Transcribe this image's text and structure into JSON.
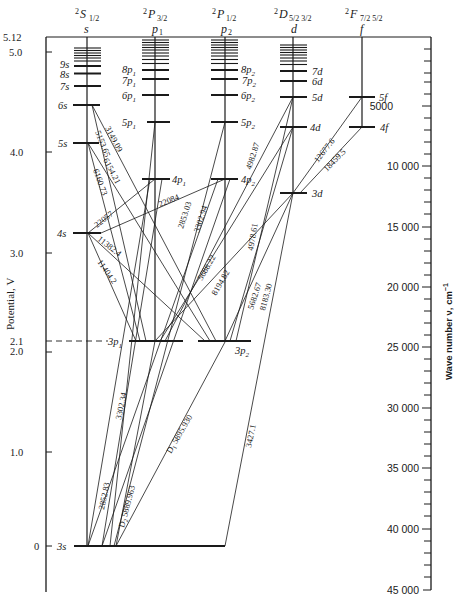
{
  "diagram": {
    "type": "Grotrian (energy-level) diagram of sodium",
    "columns": [
      {
        "term": "2S",
        "j": "1/2",
        "series": "s",
        "x": 87
      },
      {
        "term": "2P",
        "j": "3/2",
        "series": "p1",
        "x": 155
      },
      {
        "term": "2P",
        "j": "1/2",
        "series": "p2",
        "x": 225
      },
      {
        "term": "2D",
        "j": "5/2 3/2",
        "series": "d",
        "x": 293
      },
      {
        "term": "2F",
        "j": "7/2 5/2",
        "series": "f",
        "x": 362
      }
    ],
    "headers": {
      "s_term": "2",
      "s_letter": "S",
      "s_j": "1/2",
      "s_series": "s",
      "p1_term": "2",
      "p1_letter": "P",
      "p1_j": "3/2",
      "p1_series": "p",
      "p1_sub": "1",
      "p2_term": "2",
      "p2_letter": "P",
      "p2_j": "1/2",
      "p2_series": "p",
      "p2_sub": "2",
      "d_term": "2",
      "d_letter": "D",
      "d_j": "5/2 3/2",
      "d_series": "d",
      "f_term": "2",
      "f_letter": "F",
      "f_j": "7/2 5/2",
      "f_series": "f"
    },
    "left_axis": {
      "label": "Potential, V",
      "ticks": [
        "5.12",
        "5.0",
        "4.0",
        "3.0",
        "2.1",
        "2.0",
        "1.0",
        "0"
      ]
    },
    "right_axis": {
      "label": "Wave number ν, cm",
      "label_sup": "−1",
      "ticks": [
        "5000",
        "10 000",
        "15 000",
        "20 000",
        "25 000",
        "30 000",
        "35 000",
        "40 000",
        "45 000"
      ]
    },
    "levels": {
      "s": [
        {
          "label": "3s",
          "y": 546
        },
        {
          "label": "4s",
          "y": 233
        },
        {
          "label": "5s",
          "y": 143
        },
        {
          "label": "6s",
          "y": 105
        },
        {
          "label": "7s",
          "y": 86
        },
        {
          "label": "8s",
          "y": 74
        },
        {
          "label": "9s",
          "y": 65
        }
      ],
      "p1": [
        {
          "label": "3p",
          "sub": "1",
          "y": 341
        },
        {
          "label": "4p",
          "sub": "1",
          "y": 179
        },
        {
          "label": "5p",
          "sub": "1",
          "y": 122
        },
        {
          "label": "6p",
          "sub": "1",
          "y": 95
        },
        {
          "label": "7p",
          "sub": "1",
          "y": 79
        },
        {
          "label": "8p",
          "sub": "1",
          "y": 70
        }
      ],
      "p2": [
        {
          "label": "3p",
          "sub": "2",
          "y": 342
        },
        {
          "label": "4p",
          "sub": "2",
          "y": 179
        },
        {
          "label": "5p",
          "sub": "2",
          "y": 122
        },
        {
          "label": "6p",
          "sub": "2",
          "y": 95
        },
        {
          "label": "7p",
          "sub": "2",
          "y": 79
        },
        {
          "label": "8p",
          "sub": "2",
          "y": 70
        }
      ],
      "d": [
        {
          "label": "3d",
          "y": 193
        },
        {
          "label": "4d",
          "y": 127
        },
        {
          "label": "5d",
          "y": 97
        },
        {
          "label": "6d",
          "y": 81
        },
        {
          "label": "7d",
          "y": 71
        }
      ],
      "f": [
        {
          "label": "4f",
          "y": 127
        },
        {
          "label": "5f",
          "y": 97
        }
      ]
    },
    "transitions_angstrom": [
      "3149.09",
      "5153.65",
      "6154.21",
      "6160.73",
      "22057",
      "22084",
      "11382.4",
      "11404.2",
      "2853.03",
      "3302.94",
      "5688.22",
      "8194.82",
      "4982.87",
      "4978.61",
      "5682.67",
      "8183.30",
      "12677.6",
      "18459.5",
      "2852.83",
      "3302.34",
      "D2 5889.963",
      "D1 5895.930",
      "3427.1"
    ],
    "labels": {
      "t3149": "3149.09",
      "t5153": "5153.65",
      "t6154": "6154.21",
      "t6160": "6160.73",
      "t22057": "22057",
      "t22084": "22084",
      "t11382": "11382.4",
      "t11404": "11404.2",
      "t2853": "2853.03",
      "t3302_94": "3302.94",
      "t5688": "5688.22",
      "t8194": "8194.82",
      "t4982": "4982.87",
      "t4978": "4978.61",
      "t5682": "5682.67",
      "t8183": "8183.30",
      "t12677": "12677.6",
      "t18459": "18459.5",
      "t2852": "2852.83",
      "t3302_34": "3302.34",
      "tD2_letter": "D",
      "tD2_sub": "2",
      "tD2_val": "5889.963",
      "tD1_letter": "D",
      "tD1_sub": "1",
      "tD1_val": "5895.930",
      "t3427": "3427.1"
    }
  }
}
